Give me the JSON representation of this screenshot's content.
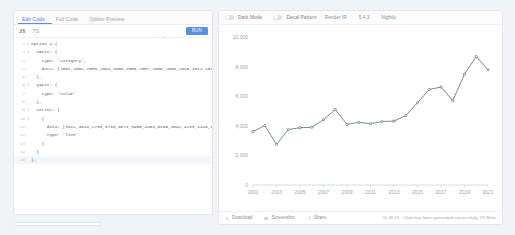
{
  "editor": {
    "tabs": [
      {
        "label": "Edit Code",
        "active": true
      },
      {
        "label": "Full Code",
        "active": false
      },
      {
        "label": "Option Preview",
        "active": false
      }
    ],
    "toolbar": {
      "lang_badge": "JS",
      "lang_mode": "TS",
      "icons": [
        "format-icon",
        "theme-icon",
        "expand-icon"
      ],
      "run_label": "RUN"
    },
    "code_lines": [
      {
        "n": "1",
        "fold": "▾",
        "text": "option = {"
      },
      {
        "n": "2",
        "fold": "▾",
        "text": "  xAxis: {"
      },
      {
        "n": "3",
        "fold": "",
        "text": "    type: 'category',"
      },
      {
        "n": "4",
        "fold": "",
        "text": "    data: [2001,2002,2003,2004,2005,2006,2007,2008,2009,2010,2011,2012,"
      },
      {
        "n": "5",
        "fold": "",
        "text": "  },"
      },
      {
        "n": "6",
        "fold": "▾",
        "text": "  yAxis: {"
      },
      {
        "n": "7",
        "fold": "",
        "text": "    type: 'value'"
      },
      {
        "n": "8",
        "fold": "",
        "text": "  },"
      },
      {
        "n": "9",
        "fold": "▾",
        "text": "  series: ["
      },
      {
        "n": "10",
        "fold": "▾",
        "text": "    {"
      },
      {
        "n": "11",
        "fold": "",
        "text": "      data: [3612,4014,2738,3746,3871,3900,4404,5109,4092,4233,4140,4287,"
      },
      {
        "n": "12",
        "fold": "",
        "text": "      type: 'line'"
      },
      {
        "n": "13",
        "fold": "",
        "text": "    }"
      },
      {
        "n": "14",
        "fold": "",
        "text": "  ]"
      },
      {
        "n": "15",
        "fold": "",
        "text": "};"
      }
    ]
  },
  "preview": {
    "header": {
      "dark_mode_label": "Dark Mode",
      "decal_label": "Decal Pattern",
      "renderer_label": "Render IR",
      "version": "5.4.3",
      "build": "Nightly"
    },
    "footer": {
      "download_label": "Download",
      "screenshot_label": "Screenshot",
      "share_label": "Share",
      "timestamp": "11:28:21",
      "status_text": "Chart has been generated successfully, 19.36ms"
    }
  },
  "chart_data": {
    "type": "line",
    "title": "",
    "xlabel": "",
    "ylabel": "",
    "grid": false,
    "legend": null,
    "categories": [
      2001,
      2002,
      2003,
      2004,
      2005,
      2006,
      2007,
      2008,
      2009,
      2010,
      2011,
      2012,
      2013,
      2014,
      2015,
      2016,
      2017,
      2018,
      2019,
      2020,
      2021
    ],
    "tick_labels_x": [
      "2001",
      "2003",
      "2005",
      "2007",
      "2009",
      "2011",
      "2013",
      "2015",
      "2017",
      "2019",
      "2021"
    ],
    "tick_labels_y": [
      "0",
      "2,000",
      "4,000",
      "6,000",
      "8,000",
      "10,000"
    ],
    "ylim": [
      0,
      10000
    ],
    "series": [
      {
        "name": "",
        "type": "line",
        "color": "#5a6a7a",
        "values": [
          3612,
          4014,
          2738,
          3746,
          3871,
          3900,
          4404,
          5109,
          4092,
          4233,
          4140,
          4287,
          4320,
          4690,
          5560,
          6450,
          6620,
          5700,
          7490,
          8680,
          7790
        ]
      }
    ]
  }
}
